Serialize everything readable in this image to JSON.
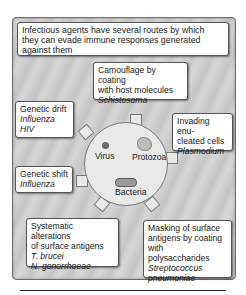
{
  "figure": {
    "header": "Infectious agents have several routes by which they can evade immune responses generated against them",
    "header_lines": [
      "Infectious agents have several routes by which",
      "they can evade immune responses generated",
      "against them"
    ],
    "center": {
      "organisms": [
        {
          "name": "Virus",
          "icon": "virus-dot-icon"
        },
        {
          "name": "Protozoa",
          "icon": "protozoa-cell-icon"
        },
        {
          "name": "Bacteria",
          "icon": "bacteria-rod-icon"
        }
      ]
    },
    "mechanisms": [
      {
        "id": "camouflage",
        "lines": [
          "Camouflage by coating",
          "with host molecules"
        ],
        "examples": [
          "Schistosoma"
        ]
      },
      {
        "id": "genetic-drift",
        "lines": [
          "Genetic drift"
        ],
        "examples": [
          "Influenza",
          "HIV"
        ]
      },
      {
        "id": "invading-enucleated",
        "lines": [
          "Invading enu-",
          "cleated cells"
        ],
        "examples": [
          "Plasmodium"
        ]
      },
      {
        "id": "genetic-shift",
        "lines": [
          "Genetic shift"
        ],
        "examples": [
          "Influenza"
        ]
      },
      {
        "id": "systematic-alterations",
        "lines": [
          "Systematic alterations",
          "of surface antigens"
        ],
        "examples": [
          "T. brucei",
          "N. gonorrhoeae"
        ]
      },
      {
        "id": "masking",
        "lines": [
          "Masking of surface",
          "antigens by coating",
          "with polysaccharides"
        ],
        "examples": [
          "Streptococcus",
          "pneumoniae"
        ]
      }
    ]
  }
}
